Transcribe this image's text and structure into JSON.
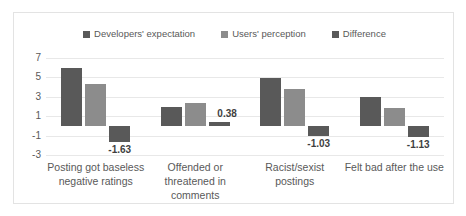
{
  "chart_data": {
    "type": "bar",
    "title": "",
    "xlabel": "",
    "ylabel": "",
    "grid": true,
    "legend_position": "top-center",
    "ylim": [
      -3,
      7
    ],
    "yticks": [
      "7",
      "5",
      "3",
      "1",
      "-1",
      "-3"
    ],
    "ytick_values": [
      7,
      5,
      3,
      1,
      -1,
      -3
    ],
    "categories": [
      "Posting got baseless negative ratings",
      "Offended or threatened in comments",
      "Racist/sexist postings",
      "Felt bad after the use"
    ],
    "series": [
      {
        "name": "Developers' expectation",
        "color": "#595959",
        "values": [
          5.95,
          1.95,
          4.9,
          2.95
        ],
        "labels": [
          "",
          "",
          "",
          ""
        ]
      },
      {
        "name": "Users' perception",
        "color": "#8c8c8c",
        "values": [
          4.3,
          2.32,
          3.85,
          1.8
        ],
        "labels": [
          "",
          "",
          "",
          ""
        ]
      },
      {
        "name": "Difference",
        "color": "#595959",
        "values": [
          -1.63,
          0.38,
          -1.03,
          -1.13
        ],
        "labels": [
          "-1.63",
          "0.38",
          "-1.03",
          "-1.13"
        ]
      }
    ]
  }
}
